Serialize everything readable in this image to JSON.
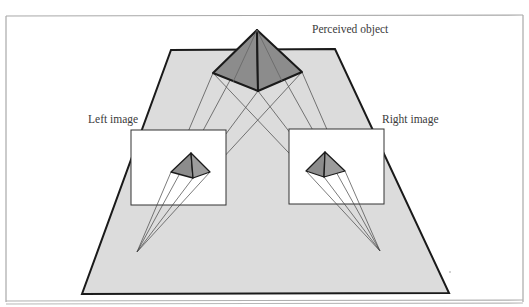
{
  "labels": {
    "perceived_object": "Perceived object",
    "left_image": "Left image",
    "right_image": "Right image"
  },
  "colors": {
    "plane_fill": "#dcdcdc",
    "plane_stroke": "#1a1a1a",
    "pyramid_fill": "#8a8a8a",
    "pyramid_light": "#a0a0a0",
    "projection_line": "#555555",
    "image_fill": "#ffffff",
    "frame_stroke": "#9a9a9a"
  }
}
